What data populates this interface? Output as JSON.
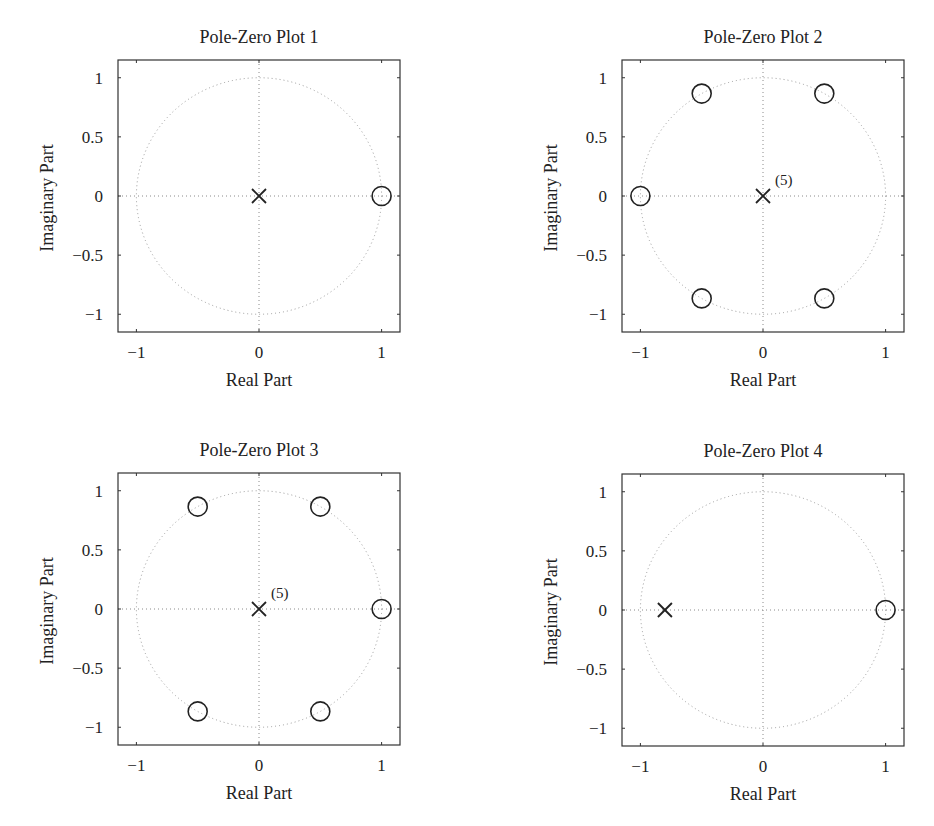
{
  "chart_data": [
    {
      "type": "scatter",
      "title": "Pole-Zero Plot 1",
      "xlabel": "Real Part",
      "ylabel": "Imaginary Part",
      "xlim": [
        -1.15,
        1.15
      ],
      "ylim": [
        -1.15,
        1.15
      ],
      "xticks": [
        -1,
        0,
        1
      ],
      "xtick_labels": [
        "−1",
        "0",
        "1"
      ],
      "yticks": [
        1,
        0.5,
        0,
        -0.5,
        -1
      ],
      "ytick_labels": [
        "1",
        "0.5",
        "0",
        "−0.5",
        "−1"
      ],
      "grid": false,
      "unit_circle": true,
      "series": [
        {
          "name": "poles",
          "marker": "x",
          "points": [
            {
              "re": 0,
              "im": 0
            }
          ],
          "multiplicity_label": ""
        },
        {
          "name": "zeros",
          "marker": "o",
          "points": [
            {
              "re": 1,
              "im": 0
            }
          ]
        }
      ]
    },
    {
      "type": "scatter",
      "title": "Pole-Zero Plot 2",
      "xlabel": "Real Part",
      "ylabel": "Imaginary Part",
      "xlim": [
        -1.15,
        1.15
      ],
      "ylim": [
        -1.15,
        1.15
      ],
      "xticks": [
        -1,
        0,
        1
      ],
      "xtick_labels": [
        "−1",
        "0",
        "1"
      ],
      "yticks": [
        1,
        0.5,
        0,
        -0.5,
        -1
      ],
      "ytick_labels": [
        "1",
        "0.5",
        "0",
        "−0.5",
        "−1"
      ],
      "grid": false,
      "unit_circle": true,
      "series": [
        {
          "name": "poles",
          "marker": "x",
          "points": [
            {
              "re": 0,
              "im": 0
            }
          ],
          "multiplicity_label": "(5)"
        },
        {
          "name": "zeros",
          "marker": "o",
          "points": [
            {
              "re": 0.5,
              "im": 0.866
            },
            {
              "re": -0.5,
              "im": 0.866
            },
            {
              "re": -1,
              "im": 0
            },
            {
              "re": -0.5,
              "im": -0.866
            },
            {
              "re": 0.5,
              "im": -0.866
            }
          ]
        }
      ]
    },
    {
      "type": "scatter",
      "title": "Pole-Zero Plot 3",
      "xlabel": "Real Part",
      "ylabel": "Imaginary Part",
      "xlim": [
        -1.15,
        1.15
      ],
      "ylim": [
        -1.15,
        1.15
      ],
      "xticks": [
        -1,
        0,
        1
      ],
      "xtick_labels": [
        "−1",
        "0",
        "1"
      ],
      "yticks": [
        1,
        0.5,
        0,
        -0.5,
        -1
      ],
      "ytick_labels": [
        "1",
        "0.5",
        "0",
        "−0.5",
        "−1"
      ],
      "grid": false,
      "unit_circle": true,
      "series": [
        {
          "name": "poles",
          "marker": "x",
          "points": [
            {
              "re": 0,
              "im": 0
            }
          ],
          "multiplicity_label": "(5)"
        },
        {
          "name": "zeros",
          "marker": "o",
          "points": [
            {
              "re": 1,
              "im": 0
            },
            {
              "re": 0.5,
              "im": 0.866
            },
            {
              "re": -0.5,
              "im": 0.866
            },
            {
              "re": -0.5,
              "im": -0.866
            },
            {
              "re": 0.5,
              "im": -0.866
            }
          ]
        }
      ]
    },
    {
      "type": "scatter",
      "title": "Pole-Zero Plot 4",
      "xlabel": "Real Part",
      "ylabel": "Imaginary Part",
      "xlim": [
        -1.15,
        1.15
      ],
      "ylim": [
        -1.15,
        1.15
      ],
      "xticks": [
        -1,
        0,
        1
      ],
      "xtick_labels": [
        "−1",
        "0",
        "1"
      ],
      "yticks": [
        1,
        0.5,
        0,
        -0.5,
        -1
      ],
      "ytick_labels": [
        "1",
        "0.5",
        "0",
        "−0.5",
        "−1"
      ],
      "grid": false,
      "unit_circle": true,
      "series": [
        {
          "name": "poles",
          "marker": "x",
          "points": [
            {
              "re": -0.8,
              "im": 0
            }
          ],
          "multiplicity_label": ""
        },
        {
          "name": "zeros",
          "marker": "o",
          "points": [
            {
              "re": 1,
              "im": 0
            }
          ]
        }
      ]
    }
  ],
  "colors": {
    "axes": "#333333",
    "marker": "#222222",
    "unit_circle": "#9a9a9a",
    "guide_lines": "#8a8a8a"
  }
}
